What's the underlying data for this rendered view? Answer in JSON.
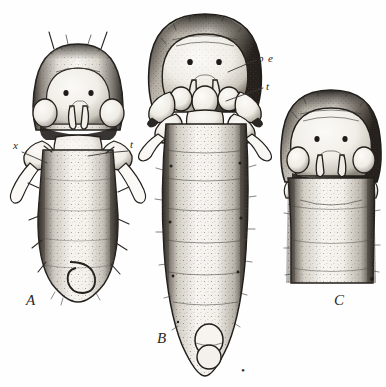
{
  "plate": {
    "title": "Insect larvae comparative plate",
    "background_color": "#fefefe",
    "ink_color": "#23201d",
    "width": 386,
    "height": 387,
    "style": "stippled line engraving"
  },
  "figures": [
    {
      "id": "A",
      "letter": "A",
      "letter_x": 26,
      "letter_y": 305,
      "description": "Elongate larva, dorsal view, with lateral appendages and scattered setae",
      "body_fill": "#f3f1ec",
      "cx": 78,
      "top": 44,
      "bottom": 300
    },
    {
      "id": "B",
      "letter": "B",
      "letter_x": 157,
      "letter_y": 343,
      "description": "Larger elongate larva, dorsal view, segmented abdomen, paired lateral lobes",
      "body_fill": "#f5f3ef",
      "cx": 205,
      "top": 14,
      "bottom": 372
    },
    {
      "id": "C",
      "letter": "C",
      "letter_x": 334,
      "letter_y": 305,
      "description": "Head and thorax only, dorsal view, cropped at lower margin",
      "body_fill": "#f3f1ec",
      "cx": 331,
      "top": 90,
      "bottom": 283
    }
  ],
  "annotations": [
    {
      "label": "x",
      "figure": "A",
      "text_x": 15,
      "text_y": 148,
      "leader_from": [
        22,
        151
      ],
      "leader_to": [
        47,
        163
      ]
    },
    {
      "label": "t",
      "figure": "A",
      "text_x": 131,
      "text_y": 147,
      "leader_from": [
        128,
        150
      ],
      "leader_to": [
        88,
        155
      ]
    },
    {
      "label": "p",
      "figure": "B",
      "text_x": 258,
      "text_y": 62,
      "leader_from": [
        256,
        60
      ],
      "leader_to": [
        228,
        72
      ]
    },
    {
      "label": "e",
      "figure": "B",
      "text_x": 268,
      "text_y": 62,
      "leader_from": null,
      "leader_to": null
    },
    {
      "label": "t",
      "figure": "B",
      "text_x": 266,
      "text_y": 89,
      "leader_from": [
        263,
        88
      ],
      "leader_to": [
        226,
        100
      ]
    }
  ],
  "marks": [
    {
      "name": "stray-mark-below-figure-b",
      "x": 242,
      "y": 371,
      "glyph": "•"
    }
  ]
}
